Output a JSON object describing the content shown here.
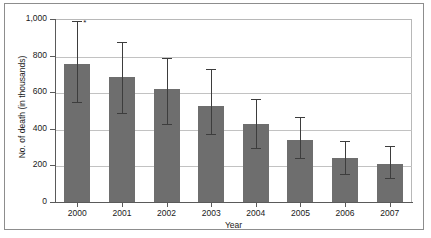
{
  "chart_data": {
    "type": "bar",
    "title": "",
    "xlabel": "Year",
    "ylabel": "No. of death (in thousands)",
    "categories": [
      "2000",
      "2001",
      "2002",
      "2003",
      "2004",
      "2005",
      "2006",
      "2007"
    ],
    "values": [
      755,
      685,
      615,
      525,
      425,
      340,
      240,
      210
    ],
    "error_low": [
      550,
      490,
      430,
      375,
      300,
      245,
      160,
      135
    ],
    "error_high": [
      995,
      880,
      795,
      730,
      570,
      470,
      340,
      310
    ],
    "annotations": [
      {
        "category": "2000",
        "text": "*",
        "meaning": "significance-marker"
      }
    ],
    "ylim": [
      0,
      1000
    ],
    "ytick_labels": [
      "0",
      "200",
      "400",
      "600",
      "800",
      "1,000"
    ],
    "ytick_values": [
      0,
      200,
      400,
      600,
      800,
      1000
    ],
    "grid": true,
    "legend": "none",
    "bar_color": "#6e6e6e",
    "error_color": "#3d3d3d",
    "grid_color": "#c2c2c2",
    "axis_color": "#5a5a5a",
    "background": "#ffffff"
  },
  "axes": {
    "x_title": "Year",
    "y_title": "No. of death (in thousands)"
  }
}
